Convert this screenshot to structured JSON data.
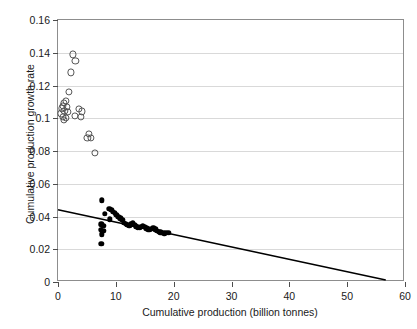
{
  "chart_data": {
    "type": "scatter",
    "title": "",
    "xlabel": "Cumulative production (billion tonnes)",
    "ylabel": "Cumulative production growth rate",
    "xlim": [
      0,
      60
    ],
    "ylim": [
      0,
      0.16
    ],
    "xticks": [
      0,
      10,
      20,
      30,
      40,
      50,
      60
    ],
    "xticklabels": [
      "0",
      "10",
      "20",
      "30",
      "40",
      "50",
      "60"
    ],
    "yticks": [
      0,
      0.02,
      0.04,
      0.06,
      0.08,
      0.1,
      0.12,
      0.14,
      0.16
    ],
    "yticklabels": [
      "0",
      "0.02",
      "0.04",
      "0.06",
      "0.08",
      "0.1",
      "0.12",
      "0.14",
      "0.16"
    ],
    "grid": "horizontal",
    "legend": "none",
    "frame": true,
    "series": [
      {
        "name": "early-period-open-circles",
        "marker": "open-circle",
        "color": "#555555",
        "points": [
          [
            2.6,
            0.139
          ],
          [
            3.0,
            0.135
          ],
          [
            2.2,
            0.128
          ],
          [
            1.9,
            0.116
          ],
          [
            1.3,
            0.1105
          ],
          [
            1.0,
            0.1095
          ],
          [
            0.9,
            0.1075
          ],
          [
            1.5,
            0.1068
          ],
          [
            0.7,
            0.106
          ],
          [
            1.1,
            0.1045
          ],
          [
            1.7,
            0.104
          ],
          [
            0.6,
            0.103
          ],
          [
            3.6,
            0.1058
          ],
          [
            4.2,
            0.1042
          ],
          [
            3.9,
            0.1008
          ],
          [
            0.8,
            0.101
          ],
          [
            1.3,
            0.1
          ],
          [
            2.9,
            0.1012
          ],
          [
            1.0,
            0.099
          ],
          [
            5.4,
            0.0905
          ],
          [
            5.1,
            0.088
          ],
          [
            5.7,
            0.0878
          ],
          [
            6.4,
            0.079
          ]
        ]
      },
      {
        "name": "later-period-filled-circles",
        "marker": "filled-circle",
        "color": "#000000",
        "points": [
          [
            7.6,
            0.05
          ],
          [
            8.9,
            0.0448
          ],
          [
            9.2,
            0.044
          ],
          [
            9.5,
            0.043
          ],
          [
            9.8,
            0.0424
          ],
          [
            8.1,
            0.0418
          ],
          [
            10.1,
            0.0412
          ],
          [
            10.4,
            0.04
          ],
          [
            9.0,
            0.0382
          ],
          [
            10.8,
            0.0388
          ],
          [
            11.1,
            0.0378
          ],
          [
            7.5,
            0.0352
          ],
          [
            7.8,
            0.0345
          ],
          [
            11.4,
            0.0362
          ],
          [
            11.7,
            0.0356
          ],
          [
            12.0,
            0.035
          ],
          [
            7.4,
            0.0318
          ],
          [
            7.9,
            0.0312
          ],
          [
            12.3,
            0.0344
          ],
          [
            12.6,
            0.0352
          ],
          [
            12.9,
            0.0358
          ],
          [
            13.2,
            0.035
          ],
          [
            7.6,
            0.0292
          ],
          [
            13.5,
            0.034
          ],
          [
            13.8,
            0.0334
          ],
          [
            14.1,
            0.033
          ],
          [
            14.4,
            0.0336
          ],
          [
            14.7,
            0.0344
          ],
          [
            15.0,
            0.0338
          ],
          [
            15.3,
            0.0328
          ],
          [
            15.6,
            0.0322
          ],
          [
            15.9,
            0.0318
          ],
          [
            16.2,
            0.0324
          ],
          [
            16.5,
            0.033
          ],
          [
            16.8,
            0.0322
          ],
          [
            17.1,
            0.0314
          ],
          [
            17.4,
            0.0308
          ],
          [
            17.7,
            0.0304
          ],
          [
            18.0,
            0.03
          ],
          [
            18.4,
            0.0298
          ],
          [
            18.8,
            0.0302
          ],
          [
            19.2,
            0.03
          ],
          [
            7.5,
            0.0235
          ]
        ]
      }
    ],
    "trendline": {
      "name": "linear-fit",
      "color": "#000000",
      "x_start": 0.0,
      "y_start": 0.0432,
      "x_end": 57.0,
      "y_end": 0.0
    }
  }
}
